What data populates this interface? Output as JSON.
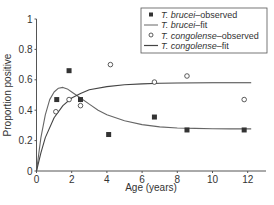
{
  "chart_data": {
    "type": "scatter",
    "title": "",
    "xlabel": "Age (years)",
    "ylabel": "Proportion positive",
    "xlim": [
      0,
      13
    ],
    "ylim": [
      0,
      1
    ],
    "xticks": [
      0,
      2,
      4,
      6,
      8,
      10,
      12
    ],
    "yticks": [
      0,
      0.2,
      0.4,
      0.6,
      0.8,
      1
    ],
    "ytick_labels": [
      "0",
      "0.2",
      "0.4",
      "0.6",
      "0.8",
      "1"
    ],
    "grid": false,
    "legend_position": "upper right",
    "series": [
      {
        "name": "T. brucei–observed",
        "species": "T. brucei",
        "suffix": "–observed",
        "kind": "scatter",
        "marker": "filled-square",
        "color": "#333333",
        "x": [
          1.15,
          1.85,
          2.5,
          4.1,
          6.7,
          8.55,
          11.8
        ],
        "y": [
          0.47,
          0.66,
          0.47,
          0.24,
          0.355,
          0.27,
          0.27
        ]
      },
      {
        "name": "T. brucei–fit",
        "species": "T. brucei",
        "suffix": "–fit",
        "kind": "line",
        "color": "#666666",
        "x": [
          0,
          0.25,
          0.5,
          0.75,
          1,
          1.25,
          1.5,
          1.75,
          2,
          2.5,
          3,
          3.5,
          4,
          5,
          6,
          7,
          8,
          9,
          10,
          11,
          12.2
        ],
        "y": [
          0,
          0.22,
          0.37,
          0.47,
          0.52,
          0.545,
          0.55,
          0.54,
          0.52,
          0.48,
          0.44,
          0.4,
          0.37,
          0.33,
          0.305,
          0.29,
          0.283,
          0.28,
          0.278,
          0.277,
          0.277
        ]
      },
      {
        "name": "T. congolense–observed",
        "species": "T. congolense",
        "suffix": "–observed",
        "kind": "scatter",
        "marker": "open-circle",
        "color": "#333333",
        "x": [
          1.1,
          1.85,
          2.5,
          4.2,
          6.7,
          8.55,
          11.8
        ],
        "y": [
          0.39,
          0.47,
          0.43,
          0.7,
          0.585,
          0.625,
          0.47
        ]
      },
      {
        "name": "T. congolense–fit",
        "species": "T. congolense",
        "suffix": "–fit",
        "kind": "line",
        "color": "#444444",
        "x": [
          0,
          0.25,
          0.5,
          1,
          1.5,
          2,
          2.5,
          3,
          4,
          5,
          6,
          7,
          8,
          10,
          12.2
        ],
        "y": [
          0,
          0.12,
          0.22,
          0.35,
          0.43,
          0.48,
          0.51,
          0.535,
          0.555,
          0.567,
          0.573,
          0.577,
          0.579,
          0.58,
          0.58
        ]
      }
    ]
  },
  "layout": {
    "plot_left": 36.5,
    "plot_bottom": 171,
    "px_per_x": 17.6,
    "px_per_y": 152,
    "axis_right": 266,
    "axis_top": 19
  }
}
